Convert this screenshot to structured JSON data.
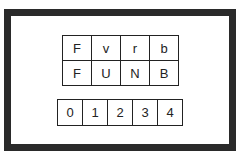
{
  "letter_grid": {
    "rows": [
      [
        "F",
        "v",
        "r",
        "b"
      ],
      [
        "F",
        "U",
        "N",
        "B"
      ]
    ]
  },
  "index_row": {
    "cells": [
      "0",
      "1",
      "2",
      "3",
      "4"
    ]
  }
}
